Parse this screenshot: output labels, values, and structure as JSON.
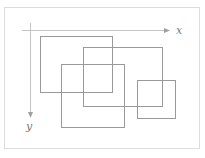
{
  "diagram": {
    "frame": {
      "x": 4,
      "y": 7,
      "w": 196,
      "h": 142,
      "color": "#dcdcdc"
    },
    "axes": {
      "color": "#b0b0b0",
      "x_axis": {
        "label": "x",
        "x1": 22,
        "y": 30,
        "x2": 170
      },
      "y_axis": {
        "label": "y",
        "x": 30,
        "y1": 23,
        "y2": 117
      }
    },
    "rect_color": "#9a9a9a",
    "rectangles": [
      {
        "x": 40,
        "y": 36,
        "w": 72,
        "h": 56
      },
      {
        "x": 83,
        "y": 47,
        "w": 79,
        "h": 59
      },
      {
        "x": 61,
        "y": 64,
        "w": 63,
        "h": 63
      },
      {
        "x": 137,
        "y": 80,
        "w": 38,
        "h": 38
      }
    ]
  }
}
